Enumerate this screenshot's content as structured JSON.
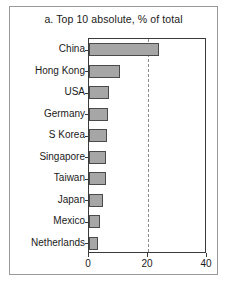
{
  "chart_data": {
    "type": "bar",
    "orientation": "horizontal",
    "title": "a. Top 10 absolute, % of total",
    "xlabel": "",
    "ylabel": "",
    "categories": [
      "China",
      "Hong Kong",
      "USA",
      "Germany",
      "S Korea",
      "Singapore",
      "Taiwan",
      "Japan",
      "Mexico",
      "Netherlands"
    ],
    "values": [
      23.6,
      10.6,
      6.8,
      6.5,
      6.2,
      5.9,
      5.6,
      4.8,
      3.6,
      3.0
    ],
    "xlim": [
      0,
      40
    ],
    "xticks": [
      0,
      20,
      40
    ],
    "xtick_labels": [
      "0",
      "20",
      "40"
    ],
    "gridlines": [
      20
    ],
    "grid": "dashed-vertical-at-20",
    "legend": null,
    "bar_fill_color": "#a6a6a6",
    "bar_edge_color": "#4a4a4a",
    "axis_color": "#3a3a3a",
    "frame_color": "#9a9a9a"
  }
}
